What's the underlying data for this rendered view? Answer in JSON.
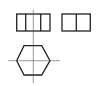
{
  "diagram": {
    "colors": {
      "outline": "#222222",
      "centerline": "#555555",
      "background": "#ffffff"
    },
    "views": [
      {
        "name": "front-view",
        "shape": "rectangle with two internal edges"
      },
      {
        "name": "side-view",
        "shape": "rectangle with one internal edge"
      },
      {
        "name": "top-view",
        "shape": "hexagon with center lines"
      }
    ]
  }
}
